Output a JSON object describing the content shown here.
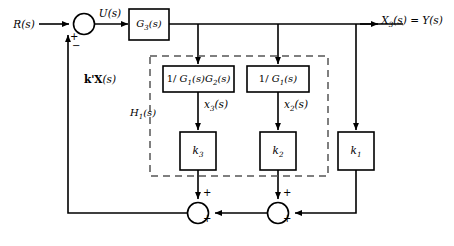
{
  "diagram": {
    "stroke_color": "#000000",
    "background_color": "#ffffff",
    "dashed_color": "#555555",
    "signals": {
      "input": "R(s)",
      "control": "U(s)",
      "output": "X3(s) = Y(s)",
      "feedback": "k'X(s)",
      "state3": "x3(s)",
      "state2": "x2(s)"
    },
    "blocks": {
      "plant": "G3(s)",
      "inv_g1g2": "1/ G1(s)G2(s)",
      "inv_g1": "1/ G1(s)",
      "gain3": "k3",
      "gain2": "k2",
      "gain1": "k1"
    },
    "boundary_label": "H1(s)",
    "signs": {
      "sum1_left": "+",
      "sum1_bottom": "−",
      "sum2_top": "+",
      "sum2_right": "+",
      "sum3_top": "+",
      "sum3_right": "+"
    }
  }
}
